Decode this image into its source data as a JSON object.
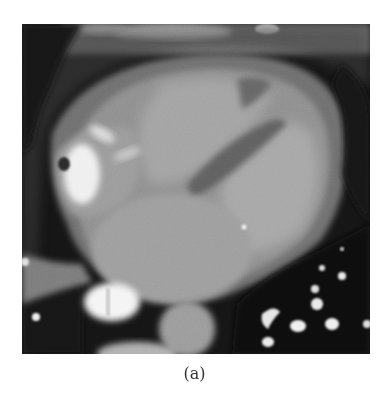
{
  "figure": {
    "caption": "(a)",
    "image": {
      "description": "Axial contrast-enhanced cardiac CT slice (grayscale)",
      "modality": "CT",
      "colors": {
        "background_air": "#111111",
        "soft_tissue": "#8a8a8a",
        "blood_pool": "#a5a5a5",
        "contrast_bright": "#f2f2f2",
        "fat": "#4a4a4a"
      }
    }
  }
}
